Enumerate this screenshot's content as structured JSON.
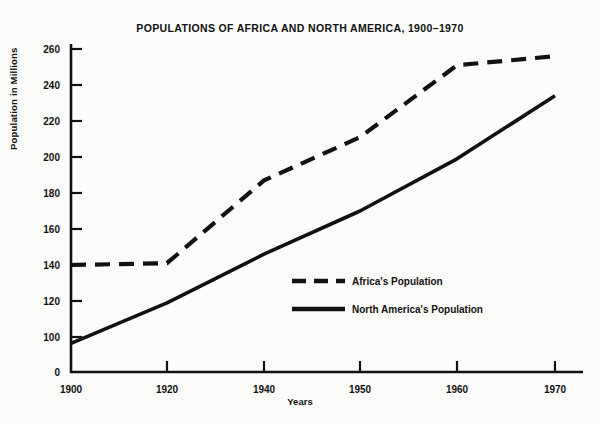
{
  "chart_data": {
    "type": "line",
    "title": "POPULATIONS OF AFRICA AND NORTH AMERICA, 1900–1970",
    "xlabel": "Years",
    "ylabel": "Population in Millions",
    "x": [
      1900,
      1920,
      1940,
      1950,
      1960,
      1970
    ],
    "xtick_labels": [
      "1900",
      "1920",
      "1940",
      "1950",
      "1960",
      "1970"
    ],
    "ytick_labels": [
      "0",
      "100",
      "120",
      "140",
      "160",
      "180",
      "200",
      "220",
      "240",
      "260"
    ],
    "yticks": [
      0,
      100,
      120,
      140,
      160,
      180,
      200,
      220,
      240,
      260
    ],
    "ylim": [
      0,
      268
    ],
    "axis_note": "y-axis broken between 0 and 100",
    "grid": false,
    "legend_position": "inside-center-right",
    "series": [
      {
        "name": "Africa's Population",
        "style": "dashed",
        "color": "#111111",
        "values": [
          140,
          141,
          187,
          211,
          251,
          256
        ]
      },
      {
        "name": "North America's Population",
        "style": "solid",
        "color": "#111111",
        "values": [
          82,
          119,
          146,
          170,
          199,
          234
        ]
      }
    ],
    "legend": [
      {
        "label": "Africa's Population",
        "style": "dashed"
      },
      {
        "label": "North America's Population",
        "style": "solid"
      }
    ]
  }
}
